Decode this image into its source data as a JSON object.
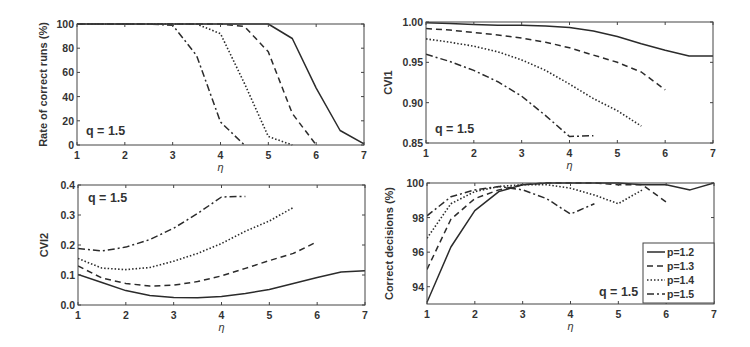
{
  "chart_data": [
    {
      "id": "rate",
      "type": "line",
      "title": "",
      "xlabel": "η",
      "ylabel": "Rate of correct runs (%)",
      "annotation": "q = 1.5",
      "xlim": [
        1,
        7
      ],
      "ylim": [
        0,
        100
      ],
      "xticks": [
        1,
        2,
        3,
        4,
        5,
        6,
        7
      ],
      "yticks": [
        0,
        20,
        40,
        60,
        80,
        100
      ],
      "ytick_labels": [
        "0",
        "20",
        "40",
        "60",
        "80",
        "100"
      ],
      "grid": false,
      "series": [
        {
          "name": "p=1.2",
          "style": "solid",
          "x": [
            1,
            1.5,
            2,
            2.5,
            3,
            3.5,
            4,
            4.5,
            5,
            5.5,
            6,
            6.5,
            7
          ],
          "y": [
            100,
            100,
            100,
            100,
            100,
            100,
            100,
            100,
            100,
            88,
            47,
            12,
            1
          ]
        },
        {
          "name": "p=1.3",
          "style": "dashed",
          "x": [
            1,
            1.5,
            2,
            2.5,
            3,
            3.5,
            4,
            4.5,
            5,
            5.5,
            6
          ],
          "y": [
            100,
            100,
            100,
            100,
            100,
            100,
            100,
            98,
            77,
            26,
            0
          ]
        },
        {
          "name": "p=1.4",
          "style": "dotted",
          "x": [
            1,
            1.5,
            2,
            2.5,
            3,
            3.5,
            4,
            4.5,
            5,
            5.5
          ],
          "y": [
            100,
            100,
            100,
            100,
            100,
            100,
            92,
            51,
            7,
            0
          ]
        },
        {
          "name": "p=1.5",
          "style": "dashdot",
          "x": [
            1,
            1.5,
            2,
            2.5,
            3,
            3.5,
            4,
            4.5
          ],
          "y": [
            100,
            100,
            100,
            100,
            99,
            74,
            19,
            0
          ]
        }
      ]
    },
    {
      "id": "cvi1",
      "type": "line",
      "title": "",
      "xlabel": "η",
      "ylabel": "CVI1",
      "annotation": "q = 1.5",
      "xlim": [
        1,
        7
      ],
      "ylim": [
        0.85,
        1.0
      ],
      "xticks": [
        1,
        2,
        3,
        4,
        5,
        6,
        7
      ],
      "yticks": [
        0.85,
        0.9,
        0.95,
        1.0
      ],
      "ytick_labels": [
        "0.85",
        "0.90",
        "0.95",
        "1.00"
      ],
      "grid": false,
      "series": [
        {
          "name": "p=1.2",
          "style": "solid",
          "x": [
            1,
            1.5,
            2,
            2.5,
            3,
            3.5,
            4,
            4.5,
            5,
            5.5,
            6,
            6.5,
            7
          ],
          "y": [
            0.999,
            0.998,
            0.997,
            0.996,
            0.996,
            0.995,
            0.993,
            0.989,
            0.982,
            0.973,
            0.965,
            0.958,
            0.958
          ]
        },
        {
          "name": "p=1.3",
          "style": "dashed",
          "x": [
            1,
            1.5,
            2,
            2.5,
            3,
            3.5,
            4,
            4.5,
            5,
            5.5,
            6
          ],
          "y": [
            0.992,
            0.99,
            0.987,
            0.984,
            0.98,
            0.975,
            0.968,
            0.959,
            0.95,
            0.938,
            0.916
          ]
        },
        {
          "name": "p=1.4",
          "style": "dotted",
          "x": [
            1,
            1.5,
            2,
            2.5,
            3,
            3.5,
            4,
            4.5,
            5,
            5.5
          ],
          "y": [
            0.979,
            0.975,
            0.97,
            0.963,
            0.953,
            0.94,
            0.923,
            0.905,
            0.89,
            0.871
          ]
        },
        {
          "name": "p=1.5",
          "style": "dashdot",
          "x": [
            1,
            1.5,
            2,
            2.5,
            3,
            3.5,
            4,
            4.5
          ],
          "y": [
            0.96,
            0.951,
            0.94,
            0.926,
            0.908,
            0.884,
            0.858,
            0.859
          ]
        }
      ]
    },
    {
      "id": "cvi2",
      "type": "line",
      "title": "",
      "xlabel": "η",
      "ylabel": "CVI2",
      "annotation": "q = 1.5",
      "xlim": [
        1,
        7
      ],
      "ylim": [
        0.0,
        0.4
      ],
      "xticks": [
        1,
        2,
        3,
        4,
        5,
        6,
        7
      ],
      "yticks": [
        0.0,
        0.1,
        0.2,
        0.3,
        0.4
      ],
      "ytick_labels": [
        "0.0",
        "0.1",
        "0.2",
        "0.3",
        "0.4"
      ],
      "grid": false,
      "series": [
        {
          "name": "p=1.2",
          "style": "solid",
          "x": [
            1,
            1.5,
            2,
            2.5,
            3,
            3.5,
            4,
            4.5,
            5,
            5.5,
            6,
            6.5,
            7
          ],
          "y": [
            0.102,
            0.075,
            0.048,
            0.032,
            0.025,
            0.024,
            0.028,
            0.038,
            0.052,
            0.072,
            0.092,
            0.11,
            0.114
          ]
        },
        {
          "name": "p=1.3",
          "style": "dashed",
          "x": [
            1,
            1.5,
            2,
            2.5,
            3,
            3.5,
            4,
            4.5,
            5,
            5.5,
            6
          ],
          "y": [
            0.13,
            0.09,
            0.072,
            0.063,
            0.066,
            0.078,
            0.097,
            0.122,
            0.148,
            0.172,
            0.211
          ]
        },
        {
          "name": "p=1.4",
          "style": "dotted",
          "x": [
            1,
            1.5,
            2,
            2.5,
            3,
            3.5,
            4,
            4.5,
            5,
            5.5
          ],
          "y": [
            0.155,
            0.123,
            0.118,
            0.125,
            0.146,
            0.172,
            0.205,
            0.246,
            0.28,
            0.325
          ]
        },
        {
          "name": "p=1.5",
          "style": "dashdot",
          "x": [
            1,
            1.5,
            2,
            2.5,
            3,
            3.5,
            4,
            4.5
          ],
          "y": [
            0.188,
            0.18,
            0.193,
            0.218,
            0.256,
            0.305,
            0.36,
            0.362
          ]
        }
      ]
    },
    {
      "id": "decisions",
      "type": "line",
      "title": "",
      "xlabel": "η",
      "ylabel": "Correct decisions (%)",
      "annotation": "q = 1.5",
      "xlim": [
        1,
        7
      ],
      "ylim": [
        93,
        100
      ],
      "xticks": [
        1,
        2,
        3,
        4,
        5,
        6,
        7
      ],
      "yticks": [
        94,
        96,
        98,
        100
      ],
      "ytick_labels": [
        "94",
        "96",
        "98",
        "100"
      ],
      "grid": false,
      "legend": {
        "position": "lower right",
        "entries": [
          "p=1.2",
          "p=1.3",
          "p=1.4",
          "p=1.5"
        ]
      },
      "series": [
        {
          "name": "p=1.2",
          "style": "solid",
          "x": [
            1,
            1.5,
            2,
            2.5,
            3,
            3.5,
            4,
            4.5,
            5,
            5.5,
            6,
            6.5,
            7
          ],
          "y": [
            93.1,
            96.3,
            98.4,
            99.5,
            99.9,
            100,
            100,
            100,
            100,
            99.9,
            99.9,
            99.6,
            100
          ]
        },
        {
          "name": "p=1.3",
          "style": "dashed",
          "x": [
            1,
            1.5,
            2,
            2.5,
            3,
            3.5,
            4,
            4.5,
            5,
            5.5,
            6
          ],
          "y": [
            95.0,
            97.9,
            99.1,
            99.6,
            99.9,
            100,
            100,
            100,
            99.9,
            99.9,
            98.9
          ]
        },
        {
          "name": "p=1.4",
          "style": "dotted",
          "x": [
            1,
            1.5,
            2,
            2.5,
            3,
            3.5,
            4,
            4.5,
            5,
            5.5
          ],
          "y": [
            96.8,
            98.8,
            99.5,
            99.8,
            99.9,
            99.9,
            99.7,
            99.3,
            98.8,
            99.6
          ]
        },
        {
          "name": "p=1.5",
          "style": "dashdot",
          "x": [
            1,
            1.5,
            2,
            2.5,
            3,
            3.5,
            4,
            4.5
          ],
          "y": [
            98.1,
            99.2,
            99.6,
            99.8,
            99.6,
            99.1,
            98.2,
            98.8
          ]
        }
      ]
    }
  ],
  "layout": {
    "panels": [
      {
        "left": 77,
        "top": 24,
        "right": 364,
        "bottom": 145
      },
      {
        "left": 426,
        "top": 22,
        "right": 713,
        "bottom": 143
      },
      {
        "left": 78,
        "top": 185,
        "right": 365,
        "bottom": 305
      },
      {
        "left": 427,
        "top": 183,
        "right": 714,
        "bottom": 304
      }
    ],
    "legend_box": {
      "x": 643,
      "y": 243,
      "w": 71,
      "h": 60
    },
    "line_color": "#2b2b2b",
    "axis_color": "#444444"
  }
}
